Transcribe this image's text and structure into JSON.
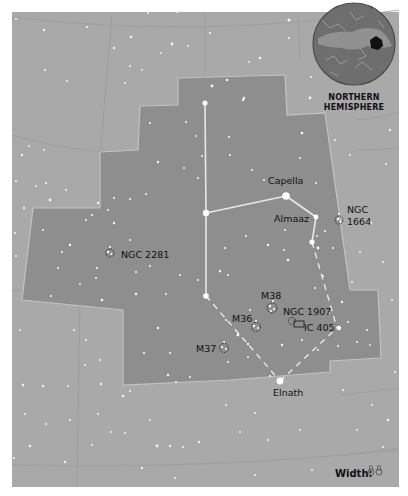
{
  "map": {
    "title": "Auriga",
    "colors": {
      "border": "#ffffff",
      "sky": "#a9a9a9",
      "constellation": "#8c8c8c",
      "grid": "#8a8a8a",
      "boundary": "#c4c4c4",
      "star": "#ffffff",
      "label": "#111111",
      "inset_fill": "#6e6e6e"
    },
    "inset": {
      "label_line1": "NORTHERN",
      "label_line2": "HEMISPHERE"
    },
    "stars_named": [
      {
        "name": "Capella",
        "label": "Capella"
      },
      {
        "name": "Almaaz",
        "label": "Almaaz"
      },
      {
        "name": "Elnath",
        "label": "Elnath"
      }
    ],
    "deep_sky_objects": [
      {
        "name": "ngc-1664",
        "label_line1": "NGC",
        "label_line2": "1664"
      },
      {
        "name": "ngc-2281",
        "label": "NGC 2281"
      },
      {
        "name": "m38",
        "label": "M38"
      },
      {
        "name": "m36",
        "label": "M36"
      },
      {
        "name": "m37",
        "label": "M37"
      },
      {
        "name": "ngc-1907",
        "label": "NGC 1907"
      },
      {
        "name": "ic-405",
        "label": "IC 405"
      }
    ],
    "width_legend": {
      "label": "Width:",
      "icon": "binoculars-icon"
    }
  }
}
